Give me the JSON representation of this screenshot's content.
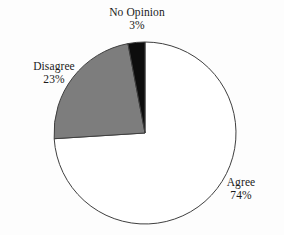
{
  "chart_data": {
    "type": "pie",
    "title": "",
    "subtitle": "",
    "xlabel": "",
    "ylabel": "",
    "legend_position": "none",
    "grid": false,
    "labels_outside": true,
    "start_angle_deg": 0,
    "direction": "clockwise",
    "categories": [
      "Agree",
      "Disagree",
      "No Opinion"
    ],
    "values": [
      74,
      23,
      3
    ],
    "units": "percent",
    "total": 100,
    "slices": [
      {
        "name": "Agree",
        "value": 74,
        "value_label": "74%",
        "color": "#ffffff",
        "stroke": "#3f3f3f",
        "label_text": "Agree",
        "start_deg": 0,
        "end_deg": 266.4
      },
      {
        "name": "Disagree",
        "value": 23,
        "value_label": "23%",
        "color": "#7d7d7d",
        "stroke": "#3f3f3f",
        "label_text": "Disagree",
        "start_deg": 266.4,
        "end_deg": 349.2
      },
      {
        "name": "No Opinion",
        "value": 3,
        "value_label": "3%",
        "color": "#0d0d0d",
        "stroke": "#3f3f3f",
        "label_text": "No Opinion",
        "start_deg": 349.2,
        "end_deg": 360
      }
    ]
  },
  "labels": {
    "no_opinion": {
      "name": "No Opinion",
      "value": "3%"
    },
    "disagree": {
      "name": "Disagree",
      "value": "23%"
    },
    "agree": {
      "name": "Agree",
      "value": "74%"
    }
  },
  "colors": {
    "background": "#fdfdfd",
    "agree_fill": "#ffffff",
    "disagree_fill": "#7d7d7d",
    "no_opinion_fill": "#0d0d0d",
    "outline": "#3f3f3f",
    "text": "#1a1a1a"
  },
  "geometry": {
    "center_x": 145,
    "center_y": 133,
    "radius": 91
  }
}
